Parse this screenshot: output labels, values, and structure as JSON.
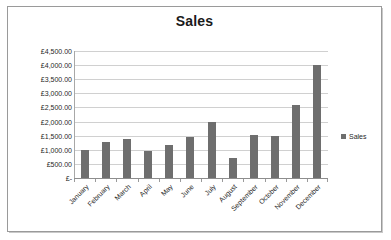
{
  "chart_data": {
    "type": "bar",
    "title": "Sales",
    "xlabel": "",
    "ylabel": "",
    "currency_symbol": "£",
    "categories": [
      "January",
      "February",
      "March",
      "April",
      "May",
      "June",
      "July",
      "August",
      "September",
      "October",
      "November",
      "December"
    ],
    "values": [
      1000,
      1280,
      1400,
      950,
      1180,
      1450,
      2000,
      700,
      1510,
      1500,
      2600,
      4000
    ],
    "series": [
      {
        "name": "Sales",
        "values": [
          1000,
          1280,
          1400,
          950,
          1180,
          1450,
          2000,
          700,
          1510,
          1500,
          2600,
          4000
        ]
      }
    ],
    "ylim": [
      0,
      4500
    ],
    "ytick_values": [
      4500,
      4000,
      3500,
      3000,
      2500,
      2000,
      1500,
      1000,
      500,
      0
    ],
    "ytick_labels": [
      "£4,500.00",
      "£4,000.00",
      "£3,500.00",
      "£3,000.00",
      "£2,500.00",
      "£2,000.00",
      "£1,500.00",
      "£1,000.00",
      "£500.00",
      "£-"
    ],
    "grid": true,
    "legend": {
      "position": "right",
      "entries": [
        "Sales"
      ]
    },
    "colors": {
      "bar": "#6e6e6e",
      "gridline": "#d0d0d0",
      "axis": "#8d8d8d",
      "text": "#1f1f1f",
      "frame": "#9a9a9a",
      "background": "#ffffff"
    }
  },
  "legend": {
    "swatch_icon": "square-marker-icon",
    "label": "Sales"
  }
}
